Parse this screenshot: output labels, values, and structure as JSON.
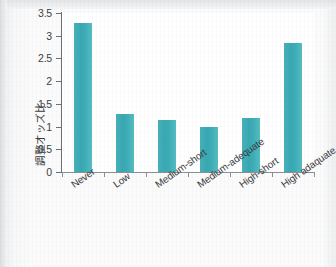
{
  "chart_data": {
    "type": "bar",
    "title": "",
    "xlabel": "",
    "ylabel": "調整オッズ比",
    "categories": [
      "Never",
      "Low",
      "Medium-short",
      "Medium-adequate",
      "High-short",
      "High adaquate"
    ],
    "values": [
      3.27,
      1.27,
      1.15,
      0.98,
      1.18,
      2.85
    ],
    "ylim": [
      0,
      3.5
    ],
    "yticks": [
      "0",
      "0.5",
      "1",
      "1.5",
      "2",
      "2.5",
      "3",
      "3.5"
    ],
    "ytick_values": [
      0,
      0.5,
      1,
      1.5,
      2,
      2.5,
      3,
      3.5
    ],
    "grid": false,
    "legend": null,
    "bar_color": "#3cadb6",
    "axis_color": "#6d6f72"
  },
  "figure": {
    "background": "#fafafa",
    "plot_background": "#ffffff"
  }
}
